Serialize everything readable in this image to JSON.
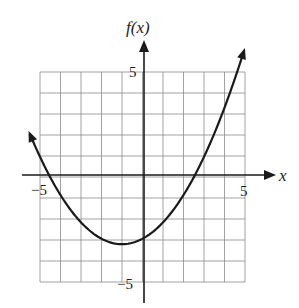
{
  "chart_data": {
    "type": "line",
    "title": "",
    "xlabel": "x",
    "ylabel": "f(x)",
    "xlim": [
      -5,
      5
    ],
    "ylim": [
      -5,
      5
    ],
    "grid": true,
    "grid_step": 1,
    "x_tick_labels": [
      {
        "value": -5,
        "label": "−5"
      },
      {
        "value": 5,
        "label": "5"
      }
    ],
    "y_tick_labels": [
      {
        "value": 5,
        "label": "5"
      },
      {
        "value": -5,
        "label": "−5"
      }
    ],
    "series": [
      {
        "name": "f(x)",
        "description": "upward-opening parabola with arrows at both ends",
        "vertex": [
          -1,
          -3.2
        ],
        "x_intercepts": [
          -4.5,
          2.5
        ],
        "y_intercept": -2.95,
        "coefficient_a": 0.26,
        "domain_drawn": [
          -5.5,
          4.95
        ],
        "points": [
          {
            "x": -5.5,
            "y": 2.07
          },
          {
            "x": -5,
            "y": 0.96
          },
          {
            "x": -4.5,
            "y": 0.0
          },
          {
            "x": -4,
            "y": -0.86
          },
          {
            "x": -3,
            "y": -2.16
          },
          {
            "x": -2,
            "y": -2.94
          },
          {
            "x": -1,
            "y": -3.2
          },
          {
            "x": 0,
            "y": -2.94
          },
          {
            "x": 1,
            "y": -2.16
          },
          {
            "x": 2,
            "y": -0.86
          },
          {
            "x": 2.5,
            "y": 0.0
          },
          {
            "x": 3,
            "y": 0.96
          },
          {
            "x": 4,
            "y": 3.3
          },
          {
            "x": 4.95,
            "y": 6.1
          }
        ]
      }
    ]
  },
  "style": {
    "grid_color": "#8a8a8a",
    "axis_color": "#1a1a1a",
    "curve_color": "#1a1a1a"
  }
}
